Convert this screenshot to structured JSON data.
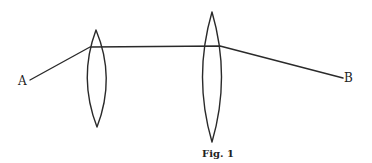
{
  "figure": {
    "caption": "Fig. 1",
    "points": {
      "start_label": "A",
      "end_label": "B"
    },
    "elements": [
      {
        "type": "lens",
        "shape": "biconvex",
        "name": "first-lens"
      },
      {
        "type": "lens",
        "shape": "biconvex",
        "name": "second-lens"
      },
      {
        "type": "ray",
        "from": "A",
        "to": "B",
        "segments": 3
      }
    ],
    "colors": {
      "ink": "#2a2a2a",
      "background": "#ffffff"
    }
  }
}
